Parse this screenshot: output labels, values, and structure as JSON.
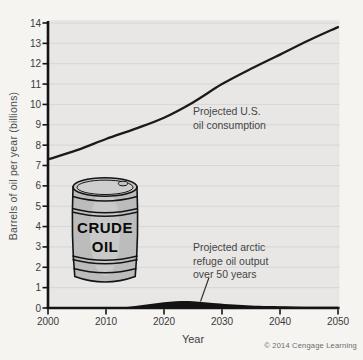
{
  "figure": {
    "y_axis_title": "Barrels of oil per year (billions)",
    "x_axis_title": "Year",
    "copyright": "© 2014 Cengage Learning"
  },
  "barrel": {
    "label_line1": "CRUDE",
    "label_line2": "OIL"
  },
  "annotations": {
    "consumption": {
      "line1": "Projected U.S.",
      "line2": "oil consumption"
    },
    "arctic": {
      "line1": "Projected arctic",
      "line2": "refuge oil output",
      "line3": "over 50 years"
    }
  },
  "chart_data": {
    "type": "line",
    "title": "",
    "xlabel": "Year",
    "ylabel": "Barrels of oil per year (billions)",
    "xlim": [
      2000,
      2050
    ],
    "ylim": [
      0,
      14
    ],
    "x_ticks": [
      2000,
      2010,
      2020,
      2030,
      2040,
      2050
    ],
    "y_ticks": [
      0,
      1,
      2,
      3,
      4,
      5,
      6,
      7,
      8,
      9,
      10,
      11,
      12,
      13,
      14
    ],
    "grid": "horizontal",
    "legend": "inline-annotations",
    "series": [
      {
        "name": "Projected U.S. oil consumption",
        "style": "line",
        "color": "#1a1a1a",
        "x": [
          2000,
          2005,
          2010,
          2015,
          2020,
          2025,
          2030,
          2035,
          2040,
          2045,
          2050
        ],
        "values": [
          7.3,
          7.75,
          8.3,
          8.8,
          9.35,
          10.1,
          11.0,
          11.75,
          12.45,
          13.15,
          13.8
        ]
      },
      {
        "name": "Projected arctic refuge oil output over 50 years",
        "style": "filled-area",
        "color": "#121212",
        "x": [
          2000,
          2008,
          2011,
          2013,
          2015,
          2017,
          2019,
          2021,
          2023,
          2025,
          2027,
          2029,
          2032,
          2035,
          2038,
          2042,
          2046,
          2050
        ],
        "values": [
          0,
          0,
          0.01,
          0.04,
          0.1,
          0.17,
          0.25,
          0.31,
          0.34,
          0.33,
          0.28,
          0.23,
          0.17,
          0.13,
          0.1,
          0.08,
          0.065,
          0.06
        ]
      }
    ],
    "colors": {
      "plot_bg": "#e8e7e5",
      "gridline": "#d7d6d4",
      "axis": "#141414",
      "annotation_text": "#454545"
    }
  }
}
